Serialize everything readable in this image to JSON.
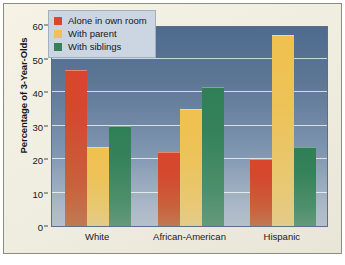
{
  "chart_data": {
    "type": "bar",
    "title": "",
    "xlabel": "",
    "ylabel": "Percentage of 3-Year-Olds",
    "ylim": [
      0,
      60
    ],
    "yticks": [
      0,
      10,
      20,
      30,
      40,
      50,
      60
    ],
    "ytick_labels": [
      "0",
      "10",
      "20",
      "30",
      "40",
      "50",
      "60"
    ],
    "grid": true,
    "legend_position": "top-left-inside",
    "categories": [
      "White",
      "African-American",
      "Hispanic"
    ],
    "series": [
      {
        "name": "Alone in own room",
        "color": "#d4492f",
        "values": [
          46.5,
          22,
          20
        ]
      },
      {
        "name": "With parent",
        "color": "#edc257",
        "values": [
          23.5,
          35,
          57
        ]
      },
      {
        "name": "With siblings",
        "color": "#35825a",
        "values": [
          30,
          41.5,
          23.5
        ]
      }
    ]
  },
  "style": {
    "page_background": "#f3f0e2",
    "frame_border": "#8d8b82",
    "plot_top_color": "#4e6b8e",
    "plot_bottom_color": "#b6c0cc",
    "gridline_color": "#ffffff",
    "legend_background": "#ccd6e2",
    "legend_border": "#9fb0c2",
    "text_color": "#17171b"
  }
}
